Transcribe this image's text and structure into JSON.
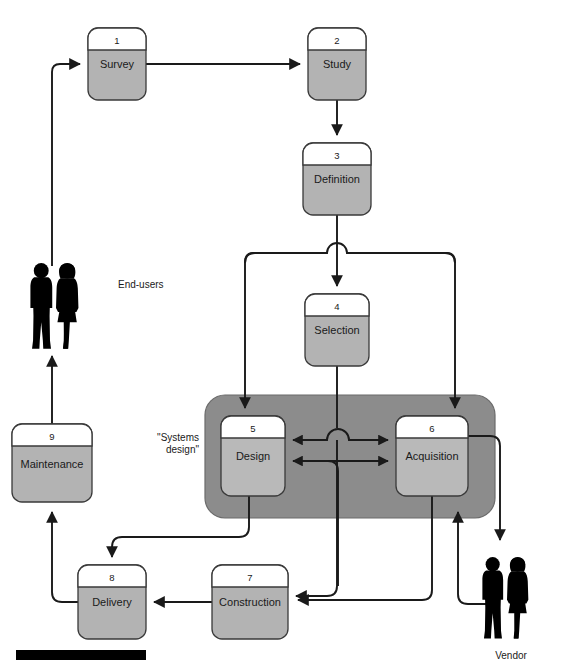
{
  "diagram": {
    "type": "flow-diagram",
    "title": "",
    "canvas": {
      "width": 563,
      "height": 666
    },
    "colors": {
      "node_fill": "#b3b3b3",
      "node_header_fill": "#ffffff",
      "node_stroke": "#3a3a3a",
      "group_fill": "#8c8c8c",
      "group_stroke": "#6b6b6b",
      "line": "#1a1a1a",
      "figure": "#000000",
      "bar": "#000000",
      "background": "#ffffff"
    },
    "nodes": [
      {
        "id": "n1",
        "number": "1",
        "label": "Survey",
        "x": 88,
        "y": 28,
        "w": 58,
        "h": 72
      },
      {
        "id": "n2",
        "number": "2",
        "label": "Study",
        "x": 308,
        "y": 28,
        "w": 58,
        "h": 72
      },
      {
        "id": "n3",
        "number": "3",
        "label": "Definition",
        "x": 303,
        "y": 143,
        "w": 68,
        "h": 72
      },
      {
        "id": "n4",
        "number": "4",
        "label": "Selection",
        "x": 305,
        "y": 294,
        "w": 64,
        "h": 72
      },
      {
        "id": "n5",
        "number": "5",
        "label": "Design",
        "x": 221,
        "y": 416,
        "w": 64,
        "h": 80
      },
      {
        "id": "n6",
        "number": "6",
        "label": "Acquisition",
        "x": 396,
        "y": 416,
        "w": 72,
        "h": 80
      },
      {
        "id": "n7",
        "number": "7",
        "label": "Construction",
        "x": 212,
        "y": 565,
        "w": 76,
        "h": 74
      },
      {
        "id": "n8",
        "number": "8",
        "label": "Delivery",
        "x": 78,
        "y": 565,
        "w": 68,
        "h": 74
      },
      {
        "id": "n9",
        "number": "9",
        "label": "Maintenance",
        "x": 12,
        "y": 424,
        "w": 80,
        "h": 78
      }
    ],
    "group": {
      "id": "systems-design-group",
      "label": "\"Systems\ndesign\"",
      "label_line1": "\"Systems",
      "label_line2": "design\"",
      "x": 205,
      "y": 395,
      "w": 290,
      "h": 123
    },
    "actors": [
      {
        "id": "end-users",
        "label": "End-users",
        "label_x": 118,
        "label_y": 288,
        "fig_x": 30,
        "fig_y": 263
      },
      {
        "id": "vendor",
        "label": "Vendor",
        "label_x": 511,
        "label_y": 659,
        "fig_x": 482,
        "fig_y": 535
      }
    ],
    "footer_bar": {
      "x": 16,
      "y": 650,
      "w": 130,
      "h": 10
    },
    "flows": [
      {
        "from": "end-users",
        "to": "Survey"
      },
      {
        "from": "Survey",
        "to": "Study"
      },
      {
        "from": "Study",
        "to": "Definition"
      },
      {
        "from": "Definition",
        "to": "Selection"
      },
      {
        "from": "Definition",
        "to": "Design"
      },
      {
        "from": "Definition",
        "to": "Acquisition"
      },
      {
        "from": "Selection",
        "to": "Design"
      },
      {
        "from": "Selection",
        "to": "Acquisition"
      },
      {
        "from": "Design",
        "to": "Acquisition",
        "bidirectional": true
      },
      {
        "from": "Design",
        "to": "Delivery"
      },
      {
        "from": "Design",
        "to": "Construction"
      },
      {
        "from": "Acquisition",
        "to": "Construction"
      },
      {
        "from": "Acquisition",
        "to": "Vendor"
      },
      {
        "from": "Vendor",
        "to": "Acquisition"
      },
      {
        "from": "Construction",
        "to": "Delivery"
      },
      {
        "from": "Delivery",
        "to": "Maintenance"
      },
      {
        "from": "Maintenance",
        "to": "End-users"
      }
    ]
  }
}
